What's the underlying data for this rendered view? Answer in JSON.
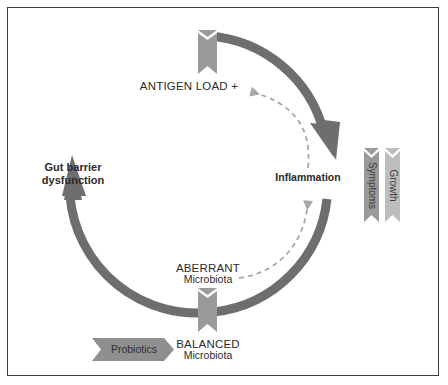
{
  "figure": {
    "border_color": "#3c3c3c",
    "background": "#ffffff"
  },
  "colors": {
    "cycle_arrow": "#6e6e6e",
    "dashed_arrow": "#a8a8a8",
    "ribbon_dark": "#9a9a9a",
    "ribbon_light": "#bdbdbd",
    "banner_fill": "#8f8f8f",
    "text": "#2b2b2b"
  },
  "cycle": {
    "nodes": [
      {
        "id": "antigen-load",
        "label": "ANTIGEN LOAD +",
        "sublabel": "",
        "style": "caps"
      },
      {
        "id": "inflammation",
        "label": "Inflammation",
        "sublabel": "",
        "style": "bold"
      },
      {
        "id": "aberrant-microbiota",
        "label": "ABERRANT",
        "sublabel": "Microbiota",
        "style": "caps"
      },
      {
        "id": "balanced-microbiota",
        "label": "BALANCED",
        "sublabel": "Microbiota",
        "style": "caps"
      },
      {
        "id": "gut-barrier-dysfunction",
        "label": "Gut barrier",
        "sublabel": "dysfunction",
        "style": "bold"
      }
    ],
    "direction": "clockwise"
  },
  "ribbons": {
    "top": {
      "id": "top-ribbon",
      "label": ""
    },
    "bottom": {
      "id": "bottom-ribbon",
      "label": ""
    },
    "side": [
      {
        "id": "symptoms-ribbon",
        "label": "Symptoms",
        "shade": "dark"
      },
      {
        "id": "growth-ribbon",
        "label": "Growth",
        "shade": "light"
      }
    ]
  },
  "banners": [
    {
      "id": "probiotics-banner",
      "label": "Probiotics"
    }
  ],
  "dashed_links": [
    {
      "id": "inflammation-to-antigen",
      "from": "Inflammation",
      "to": "ANTIGEN LOAD +"
    },
    {
      "id": "aberrant-to-inflammation",
      "from": "ABERRANT Microbiota",
      "to": "Inflammation"
    }
  ]
}
